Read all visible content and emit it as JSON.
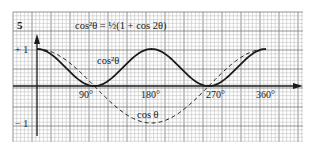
{
  "figure": {
    "number": "5",
    "title": "cos²θ = ½(1 + cos 2θ)",
    "colors": {
      "background": "#ffffff",
      "grid_minor": "#b8b8b8",
      "grid_major": "#7a7a7a",
      "ink": "#1a1a1a"
    }
  },
  "chart_data": {
    "type": "line",
    "title": "cos²θ = ½(1 + cos 2θ)",
    "xlabel": "θ (degrees)",
    "ylabel": "",
    "xlim": [
      0,
      360
    ],
    "ylim": [
      -1,
      1
    ],
    "grid": true,
    "x_ticks": [
      {
        "value": 90,
        "label": "90°"
      },
      {
        "value": 180,
        "label": "180°"
      },
      {
        "value": 270,
        "label": "270°"
      },
      {
        "value": 360,
        "label": "360°"
      }
    ],
    "y_ticks": [
      {
        "value": 1,
        "label": "+ 1"
      },
      {
        "value": -1,
        "label": "− 1"
      }
    ],
    "x": [
      0,
      30,
      45,
      60,
      90,
      120,
      135,
      150,
      180,
      210,
      225,
      240,
      270,
      300,
      315,
      330,
      360
    ],
    "series": [
      {
        "name": "cos²θ",
        "style": "solid",
        "values": [
          1,
          0.75,
          0.5,
          0.25,
          0,
          0.25,
          0.5,
          0.75,
          1,
          0.75,
          0.5,
          0.25,
          0,
          0.25,
          0.5,
          0.75,
          1
        ]
      },
      {
        "name": "cos θ",
        "style": "dashed",
        "values": [
          1,
          0.866,
          0.707,
          0.5,
          0,
          -0.5,
          -0.707,
          -0.866,
          -1,
          -0.866,
          -0.707,
          -0.5,
          0,
          0.5,
          0.707,
          0.866,
          1
        ]
      }
    ],
    "annotations": [
      {
        "text": "cos²θ",
        "near": "solid curve, x≈150°, y≈0.75"
      },
      {
        "text": "cos θ",
        "near": "dashed curve minimum, x≈180°, y≈-1"
      }
    ]
  },
  "labels": {
    "figure_number": "5",
    "equation": "cos²θ = ½(1 + cos 2θ)",
    "curve_cos2": "cos²θ",
    "curve_cos": "cos θ",
    "y_plus_one": "+ 1",
    "y_minus_one": "− 1",
    "x_90": "90°",
    "x_180": "180°",
    "x_270": "270°",
    "x_360": "360°"
  }
}
